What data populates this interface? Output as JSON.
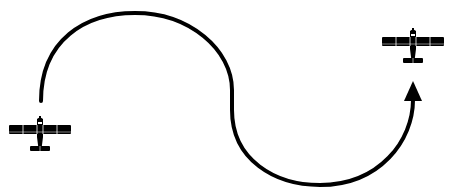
{
  "diagram": {
    "colors": {
      "background": "#ffffff",
      "stroke": "#000000",
      "aircraft": "#000000",
      "aircraft_detail": "#ffffff"
    },
    "nodes": [
      {
        "id": "start-aircraft",
        "icon": "airplane-icon",
        "label": "",
        "center": [
          40,
          133
        ]
      },
      {
        "id": "end-aircraft",
        "icon": "airplane-icon",
        "label": "",
        "center": [
          413,
          45
        ]
      }
    ],
    "edges": [
      {
        "from": "start-aircraft",
        "to": "end-aircraft",
        "shape": "s-curve",
        "arrowhead": "end",
        "label": ""
      }
    ]
  }
}
